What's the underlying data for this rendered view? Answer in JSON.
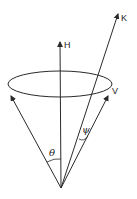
{
  "diagram": {
    "type": "cone-geometry",
    "labels": {
      "H": "H",
      "K": "K",
      "V": "V",
      "theta": "θ",
      "psi": "ψ"
    },
    "colors": {
      "stroke": "#2a2a2a",
      "background": "#ffffff"
    }
  }
}
